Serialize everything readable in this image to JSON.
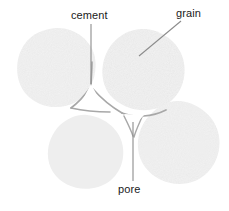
{
  "figure": {
    "width": 229,
    "height": 211,
    "background_color": "#ffffff"
  },
  "labels": [
    {
      "id": "cement",
      "text": "cement",
      "color": "#1a1a1a",
      "x": 71,
      "y": 9,
      "leader": {
        "type": "vertical",
        "x1": 91,
        "y1": 24,
        "x2": 91,
        "y2": 84,
        "color": "#8c8c8c"
      }
    },
    {
      "id": "grain",
      "text": "grain",
      "color": "#1a1a1a",
      "x": 176,
      "y": 7,
      "leader": {
        "type": "diagonal",
        "x1": 181,
        "y1": 21,
        "x2": 139,
        "y2": 56,
        "color": "#8c8c8c"
      }
    },
    {
      "id": "pore",
      "text": "pore",
      "color": "#1a1a1a",
      "x": 118,
      "y": 183,
      "leader": {
        "type": "vertical",
        "x1": 133,
        "y1": 122,
        "x2": 133,
        "y2": 181,
        "color": "#8c8c8c"
      }
    }
  ],
  "grains": [
    {
      "id": "grain-upper-left",
      "cx": 56,
      "cy": 66,
      "rx": 39,
      "ry": 38,
      "rotation": -8,
      "fill": "#f2f2f2"
    },
    {
      "id": "grain-upper-right",
      "cx": 143,
      "cy": 68,
      "rx": 41,
      "ry": 39,
      "rotation": 12,
      "fill": "#f2f2f2"
    },
    {
      "id": "grain-lower-left",
      "cx": 86,
      "cy": 151,
      "rx": 38,
      "ry": 36,
      "rotation": 5,
      "fill": "#f2f2f2"
    },
    {
      "id": "grain-lower-right",
      "cx": 178,
      "cy": 141,
      "rx": 41,
      "ry": 39,
      "rotation": -10,
      "fill": "#f2f2f2"
    }
  ],
  "cement_bonds": [
    {
      "id": "bond-left-upper",
      "color": "#a8a8a8"
    },
    {
      "id": "bond-right-upper",
      "color": "#a8a8a8"
    },
    {
      "id": "bond-center",
      "color": "#a8a8a8"
    },
    {
      "id": "bond-lower",
      "color": "#a8a8a8"
    }
  ],
  "pores": [
    {
      "id": "pore-upper",
      "cx": 92,
      "cy": 96,
      "color": "#ffffff"
    },
    {
      "id": "pore-lower",
      "cx": 133,
      "cy": 120,
      "color": "#ffffff"
    }
  ],
  "colors": {
    "grain_fill": "#f2f2f2",
    "grain_speckle": "#d4d4d4",
    "cement_line": "#a8a8a8",
    "leader_line": "#8c8c8c",
    "label_text": "#1a1a1a",
    "pore_void": "#ffffff",
    "background": "#ffffff"
  }
}
